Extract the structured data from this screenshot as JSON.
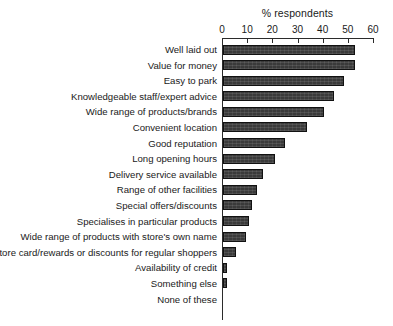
{
  "chart_data": {
    "type": "bar",
    "orientation": "horizontal",
    "title": "% respondents",
    "xlabel": "% respondents",
    "ylabel": "",
    "xlim": [
      0,
      60
    ],
    "xticks": [
      0,
      10,
      20,
      30,
      40,
      50,
      60
    ],
    "grid": false,
    "legend": null,
    "bar_color": "#3a3a3a",
    "axis_color": "#2b2b2b",
    "categories": [
      "Well laid out",
      "Value for money",
      "Easy to park",
      "Knowledgeable staff/expert advice",
      "Wide range of products/brands",
      "Convenient location",
      "Good reputation",
      "Long opening hours",
      "Delivery service available",
      "Range of other facilities",
      "Special offers/discounts",
      "Specialises in particular products",
      "Wide range of products with store's own name",
      "Store card/rewards or discounts for regular shoppers",
      "Availability of credit",
      "Something else",
      "None of these"
    ],
    "values": [
      52.5,
      52.5,
      48,
      44,
      40,
      33.5,
      24.5,
      20.5,
      16,
      13.5,
      11.5,
      10.5,
      9,
      5,
      1.5,
      1.5,
      0
    ]
  }
}
